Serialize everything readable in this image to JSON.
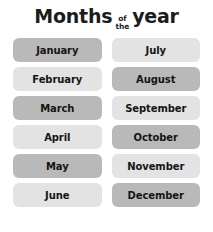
{
  "title": {
    "word1": "Months",
    "small_top": "of",
    "small_bottom": "the",
    "word2": "year"
  },
  "colors": {
    "background": "#ffffff",
    "text": "#151515",
    "chip_dark": "#b9b9b9",
    "chip_light": "#e3e3e3"
  },
  "months": [
    {
      "label": "January",
      "shade": "dark"
    },
    {
      "label": "July",
      "shade": "light"
    },
    {
      "label": "February",
      "shade": "light"
    },
    {
      "label": "August",
      "shade": "dark"
    },
    {
      "label": "March",
      "shade": "dark"
    },
    {
      "label": "September",
      "shade": "light"
    },
    {
      "label": "April",
      "shade": "light"
    },
    {
      "label": "October",
      "shade": "dark"
    },
    {
      "label": "May",
      "shade": "dark"
    },
    {
      "label": "November",
      "shade": "light"
    },
    {
      "label": "June",
      "shade": "light"
    },
    {
      "label": "December",
      "shade": "dark"
    }
  ]
}
